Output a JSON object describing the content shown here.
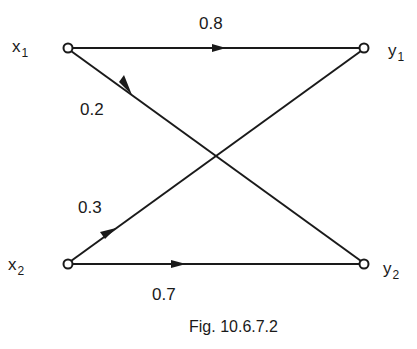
{
  "diagram": {
    "type": "bipartite-channel-graph",
    "nodes": [
      {
        "id": "x1",
        "label": "x",
        "subscript": "1"
      },
      {
        "id": "x2",
        "label": "x",
        "subscript": "2"
      },
      {
        "id": "y1",
        "label": "y",
        "subscript": "1"
      },
      {
        "id": "y2",
        "label": "y",
        "subscript": "2"
      }
    ],
    "edges": [
      {
        "from": "x1",
        "to": "y1",
        "weight": "0.8"
      },
      {
        "from": "x1",
        "to": "y2",
        "weight": "0.2"
      },
      {
        "from": "x2",
        "to": "y1",
        "weight": "0.3"
      },
      {
        "from": "x2",
        "to": "y2",
        "weight": "0.7"
      }
    ],
    "caption": "Fig. 10.6.7.2"
  }
}
